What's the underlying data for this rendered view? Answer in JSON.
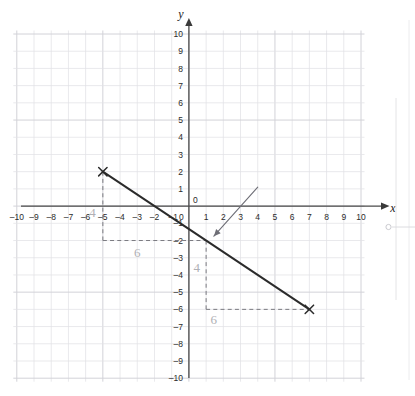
{
  "figure": {
    "kind": "cartesian-coordinate-grid",
    "background_color": "#ffffff",
    "grid_color": "#e2e2e6",
    "grid_major_color": "#d2d2d8",
    "axis_color": "#4a4a4a",
    "line_color": "#2b2b2b",
    "annotation_color": "#b0b0b5",
    "dashed_color": "#7a7a80",
    "arrow_color": "#6e6e76"
  },
  "axes": {
    "x_label": "x",
    "y_label": "y",
    "x_min": -10,
    "x_max": 10,
    "y_min": -10,
    "y_max": 10,
    "x_ticks": [
      "-10",
      "-9",
      "-8",
      "-7",
      "-6",
      "-5",
      "-4",
      "-3",
      "-2",
      "-1",
      "0",
      "1",
      "2",
      "3",
      "4",
      "5",
      "6",
      "7",
      "8",
      "9",
      "10"
    ],
    "y_ticks": [
      "10",
      "9",
      "8",
      "7",
      "6",
      "5",
      "4",
      "3",
      "2",
      "1",
      "-1",
      "-2",
      "-3",
      "-4",
      "-5",
      "-6",
      "-7",
      "-8",
      "-9",
      "-10"
    ],
    "origin_label": "0"
  },
  "chart_data": {
    "type": "line",
    "title": "",
    "xlabel": "x",
    "ylabel": "y",
    "xlim": [
      -10,
      10
    ],
    "ylim": [
      -10,
      10
    ],
    "grid": true,
    "legend": false,
    "series": [
      {
        "name": "plotted-line",
        "marked_points": [
          {
            "x": -5,
            "y": 2
          },
          {
            "x": 1,
            "y": -2
          },
          {
            "x": 7,
            "y": -6
          }
        ],
        "endpoints": [
          {
            "x": -5,
            "y": 2
          },
          {
            "x": 7,
            "y": -6
          }
        ],
        "slope": -0.6667,
        "y_intercept": -1.3333
      }
    ],
    "annotations": [
      {
        "name": "upper-rise",
        "text": "4",
        "x": -5.6,
        "y": -0.65
      },
      {
        "name": "upper-run",
        "text": "6",
        "x": -3.0,
        "y": -2.95
      },
      {
        "name": "lower-rise",
        "text": "4",
        "x": 0.45,
        "y": -3.85
      },
      {
        "name": "lower-run",
        "text": "6",
        "x": 1.45,
        "y": -6.85
      }
    ],
    "construction": [
      {
        "name": "upper-triangle-vertical",
        "from": {
          "x": -5,
          "y": 2
        },
        "to": {
          "x": -5,
          "y": -2
        },
        "style": "dashed",
        "value": 4
      },
      {
        "name": "upper-triangle-horizontal",
        "from": {
          "x": -5,
          "y": -2
        },
        "to": {
          "x": 1,
          "y": -2
        },
        "style": "dashed",
        "value": 6
      },
      {
        "name": "lower-triangle-vertical",
        "from": {
          "x": 1,
          "y": -2
        },
        "to": {
          "x": 1,
          "y": -6
        },
        "style": "dashed",
        "value": 4
      },
      {
        "name": "lower-triangle-horizontal",
        "from": {
          "x": 1,
          "y": -6
        },
        "to": {
          "x": 7,
          "y": -6
        },
        "style": "dashed",
        "value": 6
      }
    ],
    "pointer_arrow": {
      "name": "pointer-arrow",
      "from": {
        "x": 4.0,
        "y": 1.1
      },
      "to": {
        "x": 1.45,
        "y": -1.75
      }
    }
  },
  "page_artifact": {
    "name": "page-binding-mark",
    "visible": true
  }
}
